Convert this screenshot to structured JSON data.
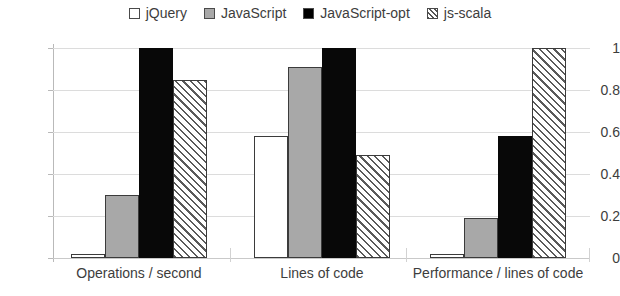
{
  "chart_data": {
    "type": "bar",
    "title": "",
    "xlabel": "",
    "ylabel": "",
    "ylim": [
      0,
      1
    ],
    "grid": true,
    "legend_position": "top-center",
    "categories": [
      "Operations / second",
      "Lines of code",
      "Performance / lines of code"
    ],
    "ytick_labels": [
      "0",
      "0.2",
      "0.4",
      "0.6",
      "0.8",
      "1"
    ],
    "ytick_values": [
      0,
      0.2,
      0.4,
      0.6,
      0.8,
      1
    ],
    "series": [
      {
        "name": "jQuery",
        "swatch": "empty",
        "color": "#ffffff",
        "values": [
          0.02,
          0.58,
          0.02
        ]
      },
      {
        "name": "JavaScript",
        "swatch": "gray",
        "color": "#a8a8a8",
        "values": [
          0.3,
          0.91,
          0.19
        ]
      },
      {
        "name": "JavaScript-opt",
        "swatch": "black",
        "color": "#080808",
        "values": [
          1.0,
          1.0,
          0.58
        ]
      },
      {
        "name": "js-scala",
        "swatch": "hatch",
        "color": "#5a5a5a",
        "values": [
          0.85,
          0.49,
          1.0
        ]
      }
    ]
  }
}
